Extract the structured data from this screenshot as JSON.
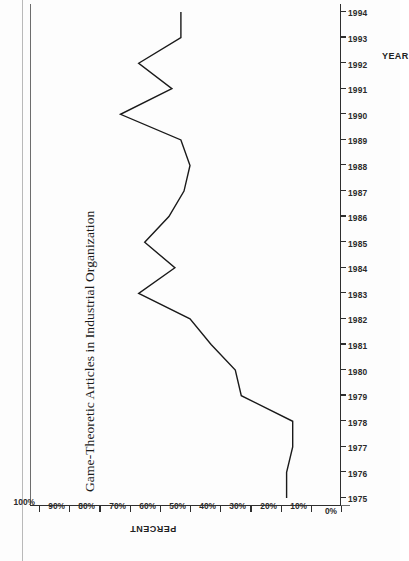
{
  "figure": {
    "title": "Game-Theoretic Articles in Industrial Organization",
    "orientation": "rotated-90-ccw",
    "line_color": "#1a1a1a",
    "axis_color": "#2f2f2f"
  },
  "chart_data": {
    "type": "line",
    "title": "Game-Theoretic Articles in Industrial Organization",
    "xlabel": "YEAR",
    "ylabel": "PERCENT",
    "x": [
      1975,
      1976,
      1977,
      1978,
      1979,
      1980,
      1981,
      1982,
      1983,
      1984,
      1985,
      1986,
      1987,
      1988,
      1989,
      1990,
      1991,
      1992,
      1993,
      1994
    ],
    "xtick_labels": [
      "1975",
      "1976",
      "1977",
      "1978",
      "1979",
      "1980",
      "1981",
      "1982",
      "1983",
      "1984",
      "1985",
      "1986",
      "1987",
      "1988",
      "1989",
      "1990",
      "1991",
      "1992",
      "1993",
      "1994"
    ],
    "values": [
      18,
      18,
      16,
      16,
      33,
      35,
      43,
      50,
      67,
      55,
      65,
      57,
      52,
      50,
      53,
      73,
      56,
      67,
      53,
      53
    ],
    "ytick_labels": [
      "0%",
      "10%",
      "20%",
      "30%",
      "40%",
      "50%",
      "60%",
      "70%",
      "80%",
      "90%",
      "100%"
    ],
    "ytick_values": [
      0,
      10,
      20,
      30,
      40,
      50,
      60,
      70,
      80,
      90,
      100
    ],
    "ylim": [
      0,
      100
    ],
    "xlim": [
      1975,
      1994
    ],
    "grid": false,
    "legend": false,
    "series_name": "Percent of game-theoretic articles"
  }
}
